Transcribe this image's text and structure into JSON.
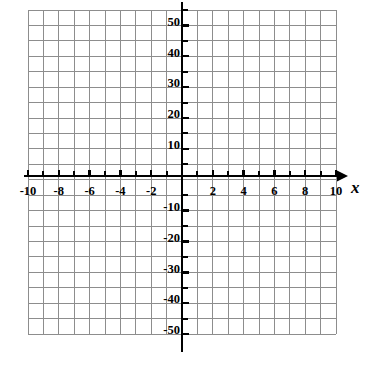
{
  "chart_data": {
    "type": "scatter",
    "title": "",
    "subtitle": "",
    "xlabel": "x",
    "ylabel": "",
    "grid": true,
    "legend": null,
    "annotations": [],
    "series": [],
    "x": [],
    "values": [],
    "xlim": [
      -11,
      11
    ],
    "ylim": [
      -52.5,
      52.5
    ],
    "x_major_step": 2,
    "x_minor_step": 1,
    "y_major_step": 10,
    "y_minor_step": 5,
    "x_tick_labels": [
      "-10",
      "-8",
      "-6",
      "-4",
      "-2",
      "2",
      "4",
      "6",
      "8",
      "10"
    ],
    "x_tick_values": [
      -10,
      -8,
      -6,
      -4,
      -2,
      2,
      4,
      6,
      8,
      10
    ],
    "y_tick_labels": [
      "50",
      "40",
      "30",
      "20",
      "10",
      "-10",
      "-20",
      "-30",
      "-40",
      "-50"
    ],
    "y_tick_values": [
      50,
      40,
      30,
      20,
      10,
      -10,
      -20,
      -30,
      -40,
      -50
    ],
    "origin_label": ""
  },
  "geometry": {
    "grid_left": 28,
    "grid_right": 336,
    "grid_top": 10,
    "grid_bottom": 334,
    "origin_x": 182,
    "origin_y": 176,
    "cell_w": 15.4,
    "cell_h": 15.43,
    "axis_x_arrow_end": 348,
    "axis_y_top": 2,
    "axis_y_bottom": 352
  },
  "colors": {
    "background": "#ffffff",
    "grid_line": "#8d8d8d",
    "axis": "#000000",
    "label_text": "#000000"
  },
  "axis_name": {
    "x": "x"
  }
}
